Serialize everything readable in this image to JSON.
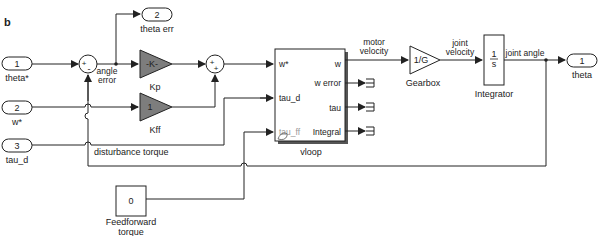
{
  "figure_label": "b",
  "inports": [
    {
      "number": "1",
      "name": "theta*"
    },
    {
      "number": "2",
      "name": "w*"
    },
    {
      "number": "3",
      "name": "tau_d"
    }
  ],
  "outports": [
    {
      "number": "2",
      "name": "theta err"
    },
    {
      "number": "1",
      "name": "theta"
    }
  ],
  "sum1": {
    "signs_top": "+",
    "signs_bottom": "-"
  },
  "sum2": {
    "signs_top": "+",
    "signs_bottom": "+"
  },
  "gains": {
    "kp": {
      "value": "-K-",
      "name": "Kp"
    },
    "kff": {
      "value": "1",
      "name": "Kff"
    },
    "gearbox": {
      "value": "1/G",
      "name": "Gearbox"
    }
  },
  "integrator": {
    "numerator": "1",
    "denominator": "s",
    "name": "Integrator"
  },
  "subsystem": {
    "name": "vloop",
    "inputs": [
      "w*",
      "tau_d",
      "tau_ff"
    ],
    "outputs": [
      "w",
      "w error",
      "tau",
      "Integral"
    ]
  },
  "constant": {
    "value": "0",
    "name_line1": "Feedforward",
    "name_line2": "torque"
  },
  "signal_labels": {
    "angle_error_1": "angle",
    "angle_error_2": "error",
    "motor_velocity_1": "motor",
    "motor_velocity_2": "velocity",
    "joint_velocity_1": "joint",
    "joint_velocity_2": "velocity",
    "joint_angle": "joint angle",
    "disturbance_torque": "disturbance torque"
  }
}
